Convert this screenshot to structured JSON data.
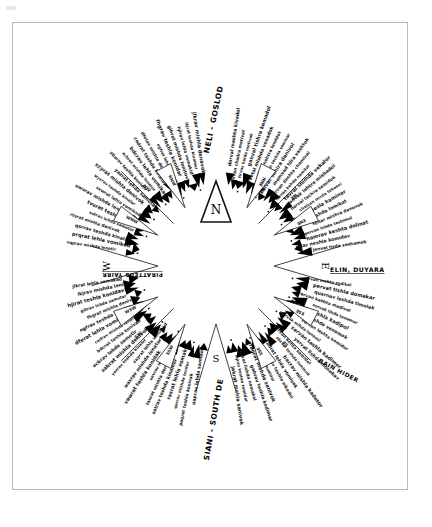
{
  "document": {
    "title": "Hand-drawn radial compass rose diagram",
    "caption": "",
    "background_color": "#ffffff",
    "ink_color": "#111111",
    "frame_color": "#b9b9b9"
  },
  "compass": {
    "center_x": 216,
    "center_y": 266,
    "inner_radius": 74,
    "outer_radius": 228,
    "north_arrow_label": "N",
    "cardinals": [
      {
        "name": "north",
        "label": "N",
        "angle_deg": 0,
        "radius": 96,
        "rotate": 0
      },
      {
        "name": "east",
        "label": "E",
        "angle_deg": 90,
        "radius": 106,
        "rotate": 90
      },
      {
        "name": "south",
        "label": "S",
        "angle_deg": 180,
        "radius": 96,
        "rotate": 0
      },
      {
        "name": "west",
        "label": "W",
        "angle_deg": 270,
        "radius": 106,
        "rotate": -90
      }
    ],
    "sector_wedges": [
      {
        "name": "wedge-nne",
        "label": "NNE",
        "angle_deg": 28
      },
      {
        "name": "wedge-ene",
        "label": "ENE",
        "angle_deg": 62
      },
      {
        "name": "wedge-ese",
        "label": "ESE",
        "angle_deg": 118
      },
      {
        "name": "wedge-sse",
        "label": "SSE",
        "angle_deg": 152
      },
      {
        "name": "wedge-ssw",
        "label": "SSW",
        "angle_deg": 208
      },
      {
        "name": "wedge-wsw",
        "label": "WSW",
        "angle_deg": 242
      },
      {
        "name": "wedge-wnw",
        "label": "WNW",
        "angle_deg": 298
      },
      {
        "name": "wedge-nnw",
        "label": "NNW",
        "angle_deg": 332
      }
    ],
    "diagonal_ticks": [
      {
        "name": "tick-ne",
        "label": "NE",
        "angle_deg": 45
      },
      {
        "name": "tick-se",
        "label": "SE",
        "angle_deg": 135
      },
      {
        "name": "tick-sw",
        "label": "SW",
        "angle_deg": 225
      },
      {
        "name": "tick-nw",
        "label": "NW",
        "angle_deg": 315
      }
    ]
  },
  "headings": {
    "top": "NELI - GOSLOD",
    "bottom": "SIANI - SOUTH DE",
    "right_underlined": "ELIN, DUYARA",
    "left_underlined": "PIRATTEDS YAIRR",
    "lower_right_bold": "BAIN HIDER"
  },
  "rays": {
    "count": 104,
    "arrowhead_color": "#000000",
    "note": "Each ray is a radial handwritten annotation line with an inward-pointing black triangular arrowhead.",
    "labels": [
      "alivaz litra chashta adat",
      "kinval hetra mivta adot",
      "dorval mashta kivadol",
      "silvan chadra metivat",
      "tirvas helda motivak",
      "ganval tishra kemadol",
      "ravtal mishda venadok",
      "solvak nehtra lamidot",
      "pirvan techda somivar",
      "kalvat sehira danivol",
      "memvad tilra vashtok",
      "hirvan deshta chamival",
      "lorvas kehda namitol",
      "tavral shimda vekalor",
      "zenvak lehtra mishadol",
      "barval techra samidok",
      "chalvan mirda tekasol",
      "dovrat hesla kaminar",
      "ervan teshda lomikat",
      "feltar mishra danovok",
      "gorvan lehda tashimol",
      "hamrav keshta dolinat",
      "ivtar neshla komidav",
      "jenval tirda seshamok",
      "korval mehsa tadinol",
      "lavrat hishda kemonav",
      "morvak teshla samidar",
      "nervat lishda kovamol",
      "orvan mehta sadikal",
      "pervat tishla domakar",
      "quarnav leshda timolak",
      "rervan keshta madivol",
      "servak lihda tonamar",
      "tervan meshla kadipol",
      "urvat tishda venamok",
      "vervan leshta komidar",
      "wervak mihda tanesol",
      "xervan teshla kadimor",
      "yervat lishda monakav",
      "zervan kehta samidol",
      "abrval teshda luminok",
      "bacrav mishla kadetor",
      "cadrat lehda vomisak",
      "daerav teshta nikadol",
      "eafrav lishla mokidar",
      "fagrat mehda sanivok",
      "gahrav teshla kodimar",
      "haivat lishda nemakol",
      "iajrav keshta tomidar",
      "jakrat mehla sanivok",
      "kalrav tishda komidor",
      "lamrat leshla vanikad",
      "manrav teshda kolimar",
      "naorat mishla tenavok",
      "oaprav lehda samidor",
      "paqrat teshla konivak",
      "qarrav mishda lenitor",
      "rasrat lehla vomakid",
      "satrav teshda kinamor",
      "taurat mishla denavok",
      "uavrav lehda samitor",
      "vawrat teshla konidak",
      "waxrav mishda lenator",
      "xayrat lehla vomikad",
      "yazrav teshda kinalor",
      "zabrat mishla denivok",
      "acbrav lehda samotir",
      "bdcrat teshla konivad",
      "cedrav mishda lenator",
      "dferat lehla vomikid",
      "egfrav teshda kinalor",
      "fhgrat mishla denivok",
      "gihrav lehda samotar",
      "hjirat teshla konidav",
      "ikjrav mishda lenitor",
      "jlkrat lehla vomakad",
      "kmlrav teshda kinamor",
      "lnmrat mishla denavik",
      "monrav lehda samitar",
      "nporat teshla konidov",
      "oqprav mishda lenatir",
      "prqrat lehla vomikod",
      "qsrrav teshda kinalar",
      "rtsrat mishla denivok",
      "sutrav lehda samotor",
      "tvurat teshla konidak",
      "uwvrav mishda lenatir",
      "vxwrat lehla vomikad",
      "wyxrav teshda kinalor",
      "xzyrat mishla denivok",
      "yazrat lehda samotar",
      "zbarav teshla konidiv",
      "acbrat mishda lenator",
      "bdcrav lehla vomikad",
      "cedrat teshda kinalor",
      "dfetav mishla denivok",
      "egfrat lehda samotur",
      "fhgrav teshla konidar",
      "gihrat mishda lenitov",
      "hjirav lehla vomakid",
      "ikjrat teshda kinamor",
      "jlkrav mishla denavok",
      "kmlrat lehda samitor",
      "lnmrav teshla konidak"
    ]
  }
}
